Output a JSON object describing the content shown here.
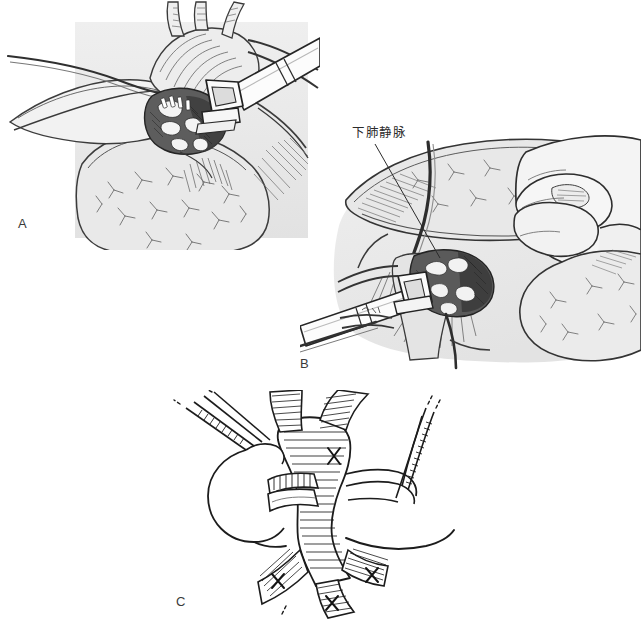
{
  "figure": {
    "background_color": "#ffffff",
    "ink_color": "#2b2b2b",
    "tint_color": "#ebebeb",
    "panel_tint_color": "#e4e4e4",
    "width": 641,
    "height": 621
  },
  "panels": [
    {
      "id": "A",
      "letter": "A",
      "letter_x": 18,
      "letter_y": 216,
      "caption": "",
      "description": "Endoscopic stapler applied across the hilar vessel with lung retracted; gray tinted rectangular field"
    },
    {
      "id": "B",
      "letter": "B",
      "letter_x": 300,
      "letter_y": 356,
      "caption": "",
      "description": "Surgeon's hand retracting the lower lobe while the stapler is placed on the inferior pulmonary vein; gray tinted rounded field"
    },
    {
      "id": "C",
      "letter": "C",
      "letter_x": 176,
      "letter_y": 594,
      "caption": "",
      "description": "Line drawing of the divided and stapled vascular stump with suture ligature loops, no background tint"
    }
  ],
  "annotations": [
    {
      "id": "inferior-pulmonary-vein",
      "text": "下肺静脉",
      "x": 352,
      "y": 129,
      "leader_from_x": 375,
      "leader_from_y": 144,
      "leader_to_x": 440,
      "leader_to_y": 258
    }
  ],
  "colors": {
    "ink": "#2b2b2b",
    "mid_gray": "#808080",
    "light_gray": "#d9d9d9",
    "panel_tint": "#e6e6e6",
    "dark_tissue": "#4a4a4a",
    "white": "#ffffff"
  }
}
